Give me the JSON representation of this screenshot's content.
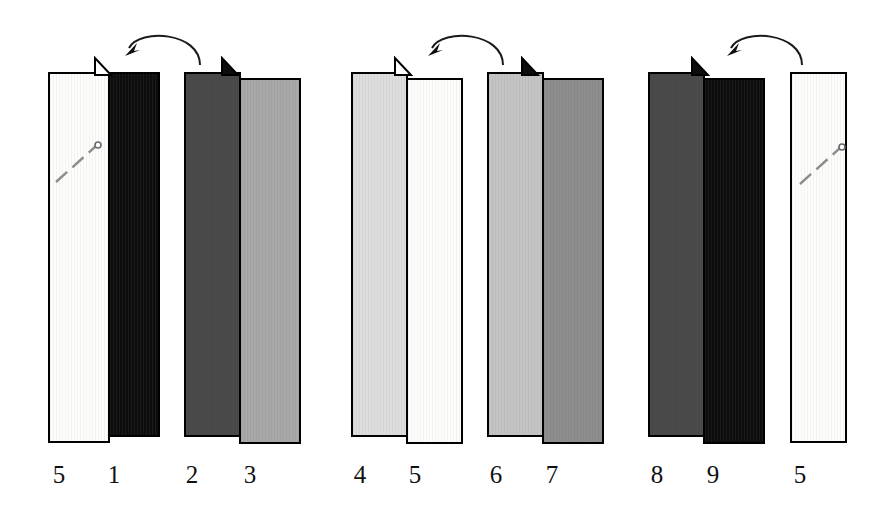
{
  "figure": {
    "background_color": "#ffffff",
    "ink_color": "#000000",
    "width": 888,
    "height": 505
  },
  "groups": [
    {
      "name": "group-1",
      "arrow": {
        "direction": "counterclockwise-left",
        "label": "flip-arrow-1"
      },
      "pairs": [
        {
          "name": "pair-5-1",
          "hinge": true,
          "panels": [
            {
              "label": "5",
              "tone": "white",
              "color": "#fdfdfb",
              "x": 48,
              "y": 72,
              "w": 62,
              "h": 371,
              "marker": "pin"
            },
            {
              "label": "1",
              "tone": "black",
              "color": "#0d0d0d",
              "x": 108,
              "y": 72,
              "w": 52,
              "h": 365,
              "marker": "none"
            }
          ]
        },
        {
          "name": "pair-2-3",
          "hinge": true,
          "panels": [
            {
              "label": "2",
              "tone": "dark",
              "color": "#4a4a4a",
              "x": 184,
              "y": 72,
              "w": 57,
              "h": 365,
              "marker": "none"
            },
            {
              "label": "3",
              "tone": "mid",
              "color": "#a8a8a8",
              "x": 239,
              "y": 78,
              "w": 62,
              "h": 366,
              "marker": "none"
            }
          ]
        }
      ]
    },
    {
      "name": "group-2",
      "arrow": {
        "direction": "counterclockwise-left",
        "label": "flip-arrow-2"
      },
      "pairs": [
        {
          "name": "pair-4-5",
          "hinge": true,
          "panels": [
            {
              "label": "4",
              "tone": "light",
              "color": "#dedede",
              "x": 351,
              "y": 72,
              "w": 57,
              "h": 365,
              "marker": "none"
            },
            {
              "label": "5",
              "tone": "white",
              "color": "#fdfdfb",
              "x": 406,
              "y": 78,
              "w": 57,
              "h": 366,
              "marker": "none"
            }
          ]
        },
        {
          "name": "pair-6-7",
          "hinge": true,
          "panels": [
            {
              "label": "6",
              "tone": "midlight",
              "color": "#c4c4c4",
              "x": 487,
              "y": 72,
              "w": 57,
              "h": 365,
              "marker": "none"
            },
            {
              "label": "7",
              "tone": "middark",
              "color": "#8e8e8e",
              "x": 542,
              "y": 78,
              "w": 62,
              "h": 366,
              "marker": "none"
            }
          ]
        }
      ]
    },
    {
      "name": "group-3",
      "arrow": {
        "direction": "counterclockwise-left",
        "label": "flip-arrow-3"
      },
      "pairs": [
        {
          "name": "pair-8-9",
          "hinge": true,
          "panels": [
            {
              "label": "8",
              "tone": "dark",
              "color": "#4a4a4a",
              "x": 648,
              "y": 72,
              "w": 57,
              "h": 365,
              "marker": "none"
            },
            {
              "label": "9",
              "tone": "black",
              "color": "#0d0d0d",
              "x": 703,
              "y": 78,
              "w": 62,
              "h": 366,
              "marker": "none"
            }
          ]
        },
        {
          "name": "pair-5-solo",
          "hinge": false,
          "panels": [
            {
              "label": "5",
              "tone": "white",
              "color": "#fdfdfb",
              "x": 790,
              "y": 72,
              "w": 57,
              "h": 371,
              "marker": "pin"
            }
          ]
        }
      ]
    }
  ],
  "labels": [
    {
      "text": "5",
      "x": 59,
      "y": 462
    },
    {
      "text": "1",
      "x": 114,
      "y": 462
    },
    {
      "text": "2",
      "x": 192,
      "y": 462
    },
    {
      "text": "3",
      "x": 250,
      "y": 462
    },
    {
      "text": "4",
      "x": 360,
      "y": 462
    },
    {
      "text": "5",
      "x": 415,
      "y": 462
    },
    {
      "text": "6",
      "x": 496,
      "y": 462
    },
    {
      "text": "7",
      "x": 552,
      "y": 462
    },
    {
      "text": "8",
      "x": 657,
      "y": 462
    },
    {
      "text": "9",
      "x": 713,
      "y": 462
    },
    {
      "text": "5",
      "x": 800,
      "y": 462
    }
  ],
  "arrows": [
    {
      "name": "flip-arrow-1",
      "x": 118,
      "y": 24,
      "w": 88,
      "h": 42
    },
    {
      "name": "flip-arrow-2",
      "x": 421,
      "y": 24,
      "w": 88,
      "h": 42
    },
    {
      "name": "flip-arrow-3",
      "x": 720,
      "y": 24,
      "w": 88,
      "h": 42
    }
  ],
  "hinges": [
    {
      "name": "hinge-1",
      "x": 92,
      "y": 56
    },
    {
      "name": "hinge-2",
      "x": 219,
      "y": 56
    },
    {
      "name": "hinge-3",
      "x": 392,
      "y": 56
    },
    {
      "name": "hinge-4",
      "x": 519,
      "y": 56
    },
    {
      "name": "hinge-5",
      "x": 689,
      "y": 56
    }
  ],
  "pins": [
    {
      "name": "pin-marker-1",
      "x": 52,
      "y": 140
    },
    {
      "name": "pin-marker-2",
      "x": 796,
      "y": 142
    }
  ]
}
